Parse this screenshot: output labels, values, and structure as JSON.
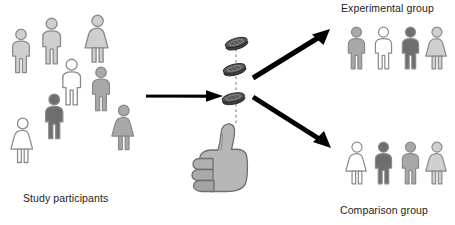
{
  "diagram": {
    "background": "#ffffff",
    "palette": {
      "outline": "#8a8a8a",
      "white": "#ffffff",
      "light_gray": "#cfcfcf",
      "medium_gray": "#a8a8a8",
      "dark_gray": "#6e6e6e",
      "arrow_black": "#000000",
      "coin_dark": "#3f3f3f",
      "hand_gray": "#b3b3b3",
      "text": "#232323"
    }
  },
  "labels": {
    "participants": "Study participants",
    "experimental": "Experimental group",
    "comparison": "Comparison group"
  },
  "groups": {
    "participants": {
      "label": "Study participants",
      "count": 8,
      "people": [
        {
          "name": "participant-1",
          "sex": "male",
          "shade": "light_gray",
          "x": 8,
          "y": 28,
          "scale": 1.0
        },
        {
          "name": "participant-2",
          "sex": "male",
          "shade": "light_gray",
          "x": 38,
          "y": 17,
          "scale": 1.05
        },
        {
          "name": "participant-3",
          "sex": "female",
          "shade": "light_gray",
          "x": 83,
          "y": 14,
          "scale": 1.08
        },
        {
          "name": "participant-4",
          "sex": "male",
          "shade": "white",
          "x": 58,
          "y": 58,
          "scale": 1.05
        },
        {
          "name": "participant-5",
          "sex": "male",
          "shade": "medium_gray",
          "x": 88,
          "y": 66,
          "scale": 1.0
        },
        {
          "name": "participant-6",
          "sex": "male",
          "shade": "dark_gray",
          "x": 41,
          "y": 93,
          "scale": 1.02
        },
        {
          "name": "participant-7",
          "sex": "female",
          "shade": "white",
          "x": 9,
          "y": 117,
          "scale": 1.02
        },
        {
          "name": "participant-8",
          "sex": "female",
          "shade": "medium_gray",
          "x": 110,
          "y": 104,
          "scale": 1.02
        }
      ]
    },
    "experimental": {
      "label": "Experimental group",
      "count": 4,
      "people": [
        {
          "name": "experimental-1",
          "sex": "male",
          "shade": "medium_gray",
          "x": 344,
          "y": 26,
          "scale": 0.96
        },
        {
          "name": "experimental-2",
          "sex": "male",
          "shade": "white",
          "x": 371,
          "y": 26,
          "scale": 0.96
        },
        {
          "name": "experimental-3",
          "sex": "male",
          "shade": "dark_gray",
          "x": 398,
          "y": 26,
          "scale": 0.96
        },
        {
          "name": "experimental-4",
          "sex": "female",
          "shade": "light_gray",
          "x": 424,
          "y": 26,
          "scale": 0.96
        }
      ]
    },
    "comparison": {
      "label": "Comparison group",
      "count": 4,
      "people": [
        {
          "name": "comparison-1",
          "sex": "female",
          "shade": "white",
          "x": 344,
          "y": 141,
          "scale": 0.96
        },
        {
          "name": "comparison-2",
          "sex": "male",
          "shade": "dark_gray",
          "x": 371,
          "y": 141,
          "scale": 0.96
        },
        {
          "name": "comparison-3",
          "sex": "male",
          "shade": "medium_gray",
          "x": 398,
          "y": 141,
          "scale": 0.96
        },
        {
          "name": "comparison-4",
          "sex": "female",
          "shade": "light_gray",
          "x": 424,
          "y": 141,
          "scale": 0.96
        }
      ]
    }
  },
  "randomizer": {
    "name": "coin-flip-randomizer",
    "hand_gesture": "thumbs-up",
    "coins": [
      {
        "name": "coin-top",
        "x": 224,
        "y": 37,
        "tilt": -16
      },
      {
        "name": "coin-middle",
        "x": 222,
        "y": 63,
        "tilt": -14
      },
      {
        "name": "coin-bottom",
        "x": 221,
        "y": 92,
        "tilt": -12
      }
    ],
    "trajectory": "dashed-vertical"
  },
  "arrows": [
    {
      "name": "arrow-participants-to-randomizer",
      "direction": "right"
    },
    {
      "name": "arrow-randomizer-to-experimental",
      "direction": "up-right"
    },
    {
      "name": "arrow-randomizer-to-comparison",
      "direction": "down-right"
    }
  ]
}
